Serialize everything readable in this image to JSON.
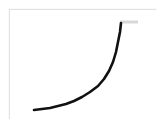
{
  "figure": {
    "title": "",
    "background_color": "#ffffff",
    "frame": {
      "border_color": "#e2e2e2",
      "fill_color": "#ffffff",
      "x": 9,
      "y": 9,
      "width": 147,
      "height": 110
    }
  },
  "chart_data": {
    "type": "line",
    "title": "",
    "subtitle": "",
    "xlabel": "",
    "ylabel": "",
    "xlim": [
      0,
      147
    ],
    "ylim": [
      0,
      110
    ],
    "grid": false,
    "legend": null,
    "axes_visible": false,
    "tick_labels_x": [],
    "tick_labels_y": [],
    "series": [
      {
        "name": "exponential-curve",
        "color": "#111111",
        "line_width": 2.6,
        "line_style": "solid",
        "marker": "none",
        "points": [
          [
            24,
            100
          ],
          [
            32,
            99
          ],
          [
            40,
            98
          ],
          [
            48,
            96
          ],
          [
            56,
            94
          ],
          [
            64,
            91
          ],
          [
            72,
            87
          ],
          [
            80,
            82
          ],
          [
            88,
            76
          ],
          [
            94,
            69
          ],
          [
            99,
            61
          ],
          [
            103,
            52
          ],
          [
            106,
            42
          ],
          [
            108,
            32
          ],
          [
            110,
            22
          ],
          [
            111,
            13
          ]
        ]
      }
    ],
    "annotations": [
      {
        "name": "top-tick-mark",
        "type": "horizontal-bar",
        "color": "#d8d8d8",
        "x_start": 110,
        "x_end": 128,
        "y": 12,
        "thickness": 3
      }
    ]
  },
  "accessibility": {
    "figure_description": "A thick black curve that is nearly flat on the left and rises steeply, almost vertically, on the right, resembling an exponential growth curve, drawn inside a thin light gray rectangular frame on a white background.",
    "curve_label": "exponential growth curve",
    "tick_label": "upper tick mark"
  }
}
